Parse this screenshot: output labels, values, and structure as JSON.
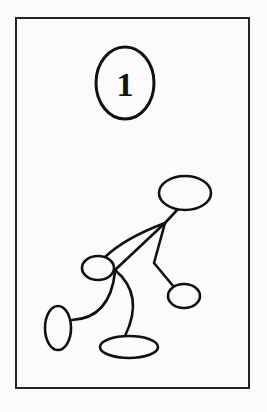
{
  "figure": {
    "label": "1",
    "stroke_color": "#111111",
    "background_color": "#fbfbfb"
  },
  "nodes": [
    {
      "id": "top",
      "shape": "ellipse"
    },
    {
      "id": "middle-left",
      "shape": "ellipse"
    },
    {
      "id": "right",
      "shape": "ellipse"
    },
    {
      "id": "bottom-left",
      "shape": "ellipse"
    },
    {
      "id": "bottom-center",
      "shape": "ellipse"
    }
  ]
}
